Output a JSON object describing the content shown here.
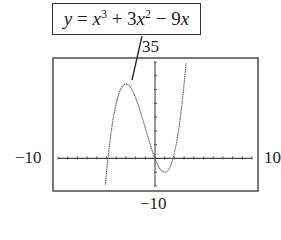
{
  "equation_label": {
    "text": "y = x^3 + 3x^2 - 9x",
    "parts": {
      "y": "y",
      "eq": " = ",
      "x1": "x",
      "exp1": "3",
      "plus": " + 3",
      "x2": "x",
      "exp2": "2",
      "minus": " − 9",
      "x3": "x"
    }
  },
  "window_labels": {
    "ymax": "35",
    "ymin": "−10",
    "xmin": "−10",
    "xmax": "10"
  },
  "colors": {
    "curve": "#555555",
    "axis": "#444444",
    "frame": "#333333"
  },
  "chart_data": {
    "type": "line",
    "xlabel": "",
    "ylabel": "",
    "xlim": [
      -10,
      10
    ],
    "ylim": [
      -10,
      35
    ],
    "x_scale_ticks": 1,
    "y_scale_ticks": 5,
    "grid": false,
    "function": "x^3 + 3x^2 - 9x",
    "key_points": [
      {
        "label": "local max",
        "x": -3,
        "y": 27
      },
      {
        "label": "local min",
        "x": 1,
        "y": -5
      },
      {
        "label": "zero",
        "x": -4.85,
        "y": 0
      },
      {
        "label": "zero",
        "x": 0,
        "y": 0
      },
      {
        "label": "zero",
        "x": 1.85,
        "y": 0
      }
    ],
    "series": [
      {
        "name": "y = x^3 + 3x^2 - 9x",
        "x": [
          -5.3,
          -5,
          -4.5,
          -4,
          -3.5,
          -3,
          -2.5,
          -2,
          -1.5,
          -1,
          -0.5,
          0,
          0.5,
          1,
          1.5,
          2,
          2.5,
          3,
          3.3
        ],
        "y": [
          -10.3,
          -5,
          7.9,
          20,
          25.4,
          27,
          25.6,
          22,
          16.9,
          11,
          5.1,
          0,
          -3.6,
          -5,
          -3.4,
          2,
          10.9,
          27,
          36.3
        ]
      }
    ]
  }
}
